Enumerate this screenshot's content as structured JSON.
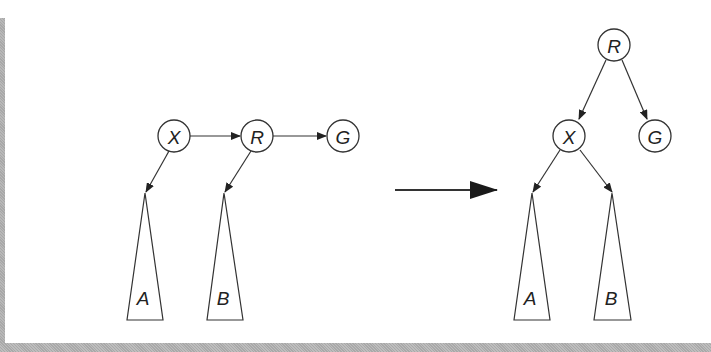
{
  "diagram": {
    "type": "tree-rotation",
    "before": {
      "nodes": [
        {
          "id": "X",
          "label": "X"
        },
        {
          "id": "R",
          "label": "R"
        },
        {
          "id": "G",
          "label": "G"
        }
      ],
      "subtrees": [
        {
          "id": "A",
          "label": "A",
          "parent": "X"
        },
        {
          "id": "B",
          "label": "B",
          "parent": "R"
        }
      ],
      "edges": [
        [
          "X",
          "R"
        ],
        [
          "R",
          "G"
        ],
        [
          "X",
          "A"
        ],
        [
          "R",
          "B"
        ]
      ]
    },
    "transition_arrow": "right-arrow",
    "after": {
      "nodes": [
        {
          "id": "R",
          "label": "R"
        },
        {
          "id": "X",
          "label": "X"
        },
        {
          "id": "G",
          "label": "G"
        }
      ],
      "subtrees": [
        {
          "id": "A",
          "label": "A",
          "parent": "X"
        },
        {
          "id": "B",
          "label": "B",
          "parent": "X"
        }
      ],
      "edges": [
        [
          "R",
          "X"
        ],
        [
          "R",
          "G"
        ],
        [
          "X",
          "A"
        ],
        [
          "X",
          "B"
        ]
      ]
    }
  }
}
